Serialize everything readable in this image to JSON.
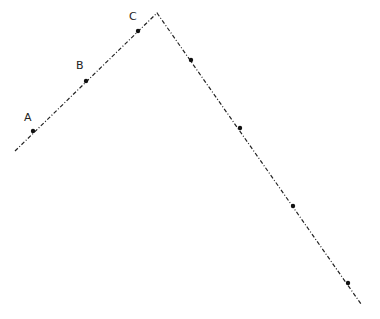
{
  "diagram": {
    "type": "polyline",
    "line_style": "dash-dot",
    "line_color": "#222222",
    "polyline": [
      [
        15,
        151
      ],
      [
        157,
        13
      ],
      [
        361,
        304
      ]
    ],
    "points": [
      {
        "label": "A",
        "x": 33,
        "y": 131,
        "lx": 24,
        "ly": 121
      },
      {
        "label": "B",
        "x": 86,
        "y": 81,
        "lx": 76,
        "ly": 69
      },
      {
        "label": "C",
        "x": 138,
        "y": 31,
        "lx": 129,
        "ly": 20
      },
      {
        "label": "",
        "x": 191,
        "y": 60
      },
      {
        "label": "",
        "x": 240,
        "y": 128
      },
      {
        "label": "",
        "x": 293,
        "y": 206
      },
      {
        "label": "",
        "x": 348,
        "y": 283
      }
    ]
  },
  "labels": {
    "a": "A",
    "b": "B",
    "c": "C"
  }
}
